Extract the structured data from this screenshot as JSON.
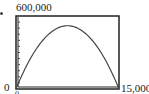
{
  "chart_data": {
    "type": "line",
    "title": "",
    "xlabel": "",
    "ylabel": "",
    "xlim": [
      0,
      15000
    ],
    "ylim": [
      0,
      600000
    ],
    "x_tick_labels": [
      "0",
      "15,000"
    ],
    "y_tick_labels": [
      "0",
      "600,000"
    ],
    "y_tick_marks": 12,
    "grid": false,
    "legend": null,
    "series": [
      {
        "name": "parabola",
        "x": [
          0,
          1500,
          3000,
          4500,
          6000,
          7500,
          9000,
          10500,
          12000,
          13500,
          15000
        ],
        "values": [
          0,
          187000,
          333000,
          437000,
          500000,
          520000,
          500000,
          437000,
          333000,
          187000,
          0
        ]
      }
    ]
  },
  "labels": {
    "y_max": "600,000",
    "y_min": "0",
    "x_min": "0",
    "x_max": "15,000"
  },
  "colors": {
    "frame": "#222222",
    "curve": "#444444"
  }
}
